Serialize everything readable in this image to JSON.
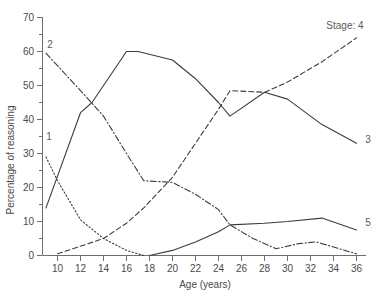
{
  "chart_data": {
    "type": "line",
    "title": "",
    "xlabel": "Age (years)",
    "ylabel": "Percentage of reasoning",
    "xlim": [
      9,
      36
    ],
    "ylim": [
      0,
      70
    ],
    "xticks": [
      10,
      12,
      14,
      16,
      18,
      20,
      22,
      24,
      26,
      28,
      30,
      32,
      34,
      36
    ],
    "yticks": [
      0,
      10,
      20,
      30,
      40,
      50,
      60,
      70
    ],
    "y_minor_ticks": [
      5,
      15,
      25,
      35,
      45,
      55,
      65
    ],
    "grid": false,
    "legend_position": "inline-end-labels",
    "legend_note": "Stage: 4",
    "series": [
      {
        "name": "1",
        "label": "1",
        "style": "dotted",
        "label_position": "start",
        "x": [
          9,
          10,
          12,
          14,
          16,
          17.5
        ],
        "y": [
          29,
          22,
          10.5,
          5,
          1.5,
          0
        ]
      },
      {
        "name": "2",
        "label": "2",
        "style": "dash-dot",
        "label_position": "start",
        "x": [
          9,
          12,
          14,
          16,
          17.5,
          20,
          22,
          24,
          25,
          27,
          29,
          31,
          32.5,
          34,
          36
        ],
        "y": [
          59.5,
          48.5,
          41,
          30,
          22,
          21.5,
          18,
          13.5,
          9,
          5,
          2,
          3.5,
          4,
          2.5,
          0.5
        ]
      },
      {
        "name": "3",
        "label": "3",
        "style": "solid",
        "label_position": "end",
        "x": [
          9,
          12,
          13,
          16,
          17,
          20,
          22,
          24,
          25,
          28,
          30,
          33,
          36
        ],
        "y": [
          14,
          42,
          45,
          60,
          60,
          57.5,
          52,
          45,
          41,
          48,
          46,
          38.5,
          33
        ]
      },
      {
        "name": "4",
        "label": "Stage: 4",
        "style": "dashed",
        "label_position": "end",
        "x": [
          10,
          14,
          16,
          17.5,
          20,
          22,
          24,
          25,
          28,
          30,
          33,
          36
        ],
        "y": [
          0.5,
          5,
          9.5,
          14,
          23,
          33,
          43,
          48.5,
          48,
          51,
          57,
          64
        ]
      },
      {
        "name": "5",
        "label": "5",
        "style": "solid",
        "label_position": "end",
        "x": [
          18,
          20,
          22,
          24,
          25,
          28,
          30,
          33,
          36
        ],
        "y": [
          0,
          1.5,
          4,
          7,
          9,
          9.5,
          10,
          11,
          7.5
        ]
      }
    ]
  },
  "axis": {
    "x_title": "Age (years)",
    "y_title": "Percentage of reasoning",
    "x_tick_labels": [
      "10",
      "12",
      "14",
      "16",
      "18",
      "20",
      "22",
      "24",
      "26",
      "28",
      "30",
      "32",
      "34",
      "36"
    ],
    "y_tick_labels": [
      "0",
      "10",
      "20",
      "30",
      "40",
      "50",
      "60",
      "70"
    ]
  },
  "labels": {
    "stage1": "1",
    "stage2": "2",
    "stage3": "3",
    "stage4": "Stage: 4",
    "stage5": "5"
  },
  "colors": {
    "line": "#3c3c3c",
    "axis": "#6e6e6e",
    "text": "#4a4a4a",
    "background": "#ffffff"
  }
}
